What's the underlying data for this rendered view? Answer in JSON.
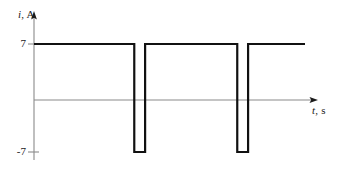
{
  "chart_data": {
    "type": "line",
    "title": "",
    "subtitle": "",
    "xlabel": "t, s",
    "ylabel": "i, A",
    "xlabel_var": "t",
    "xlabel_unit": ", s",
    "ylabel_var": "i",
    "ylabel_unit": ", A",
    "grid": false,
    "legend": false,
    "legend_position": "none",
    "ylim": [
      -7,
      7
    ],
    "xlim": [
      0,
      10
    ],
    "ytick_labels": [
      "7",
      "-7"
    ],
    "ytick_values": [
      7,
      -7
    ],
    "xtick_labels": [],
    "xtick_values": [],
    "axis_arrows": [
      "x-right",
      "y-up"
    ],
    "series": [
      {
        "name": "i(t)",
        "color": "#111111",
        "x": [
          0.0,
          3.7,
          3.7,
          4.1,
          4.1,
          7.5,
          7.5,
          7.9,
          7.9,
          10.0
        ],
        "values": [
          7,
          7,
          -7,
          -7,
          7,
          7,
          -7,
          -7,
          7,
          7
        ]
      }
    ],
    "waveform": {
      "high_level": 7,
      "low_level": -7,
      "pulse_count": 2,
      "pulse_width": 0.4,
      "period": 3.8,
      "unit_y": "A",
      "unit_x": "s"
    }
  },
  "style": {
    "waveform_color": "#111111",
    "axis_color": "#8a8a8a",
    "text_color": "#1a1a1a",
    "background": "#ffffff",
    "waveform_width": 2.2,
    "axis_width": 1
  }
}
